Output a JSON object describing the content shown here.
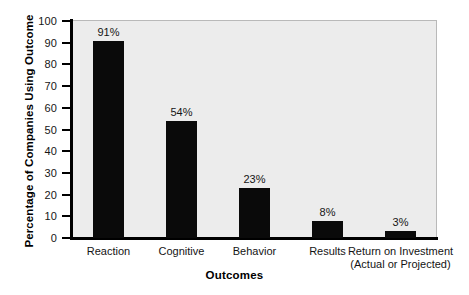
{
  "chart_data": {
    "type": "bar",
    "title": "",
    "categories": [
      "Reaction",
      "Cognitive",
      "Behavior",
      "Results",
      "Return on Investment"
    ],
    "category_sublabels": [
      "",
      "",
      "",
      "",
      "(Actual or Projected)"
    ],
    "values": [
      91,
      54,
      23,
      8,
      3
    ],
    "value_labels": [
      "91%",
      "54%",
      "23%",
      "8%",
      "3%"
    ],
    "xlabel": "Outcomes",
    "ylabel": "Percentage of Companies Using Outcome",
    "ylim": [
      0,
      100
    ],
    "yticks": [
      100,
      90,
      80,
      70,
      60,
      50,
      40,
      30,
      20,
      10,
      0
    ],
    "ytick_labels": [
      "100",
      "90",
      "80",
      "70",
      "60",
      "50",
      "40",
      "30",
      "20",
      "10",
      "0"
    ],
    "grid": false,
    "legend": null,
    "bar_color": "#0a0a0a",
    "plot_background": "#ececec",
    "figure_background": "#ffffff",
    "axis_color": "#000000"
  }
}
